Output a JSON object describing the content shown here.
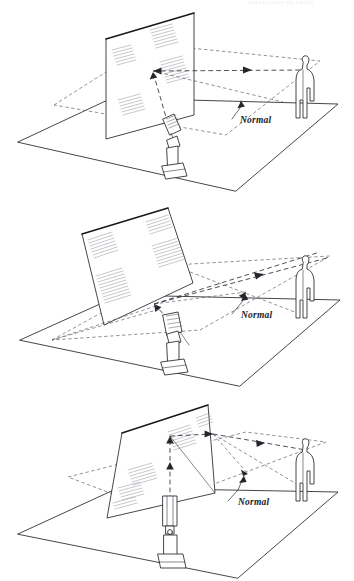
{
  "figure": {
    "page_header": "REFLECTION OF LIGHT",
    "background_color": "#ffffff",
    "line_color": "#23262b",
    "accent_color": "#15181c"
  },
  "panels": [
    {
      "id": "panel-1",
      "caption": "Mirror vertical — beam reflects horizontally toward observer",
      "normal_label": "Normal",
      "mirror": {
        "name": "plane-mirror",
        "orientation": "vertical"
      },
      "light_source": {
        "name": "projector-lamp",
        "position": "center-front"
      },
      "observer": {
        "name": "standing-person",
        "position": "right"
      },
      "ground_plane": {
        "name": "floor-plane",
        "style": "solid"
      },
      "normal_plane": {
        "name": "normal-reference-plane",
        "style": "dashed"
      },
      "rays": [
        {
          "name": "incident-ray",
          "style": "dashed",
          "arrow": true
        },
        {
          "name": "reflected-ray",
          "style": "dashed",
          "arrow": true
        },
        {
          "name": "normal-line",
          "style": "dashed",
          "arrow": false
        }
      ]
    },
    {
      "id": "panel-2",
      "caption": "Mirror tilted back — reflected beam rises above observer",
      "normal_label": "Normal",
      "mirror": {
        "name": "plane-mirror",
        "orientation": "tilted-back"
      },
      "light_source": {
        "name": "projector-lamp",
        "position": "center-front"
      },
      "observer": {
        "name": "standing-person",
        "position": "right"
      },
      "ground_plane": {
        "name": "floor-plane",
        "style": "solid"
      },
      "normal_plane": {
        "name": "normal-reference-plane",
        "style": "dashed"
      },
      "rays": [
        {
          "name": "incident-ray",
          "style": "dashed",
          "arrow": true
        },
        {
          "name": "reflected-ray",
          "style": "dashed",
          "arrow": true
        },
        {
          "name": "normal-line",
          "style": "dashed",
          "arrow": true
        }
      ]
    },
    {
      "id": "panel-3",
      "caption": "Mirror rotated sideways — beam reflects off to the right",
      "normal_label": "Normal",
      "mirror": {
        "name": "plane-mirror",
        "orientation": "rotated-oblique"
      },
      "light_source": {
        "name": "projector-lamp",
        "position": "center-front"
      },
      "observer": {
        "name": "standing-person",
        "position": "right"
      },
      "ground_plane": {
        "name": "floor-plane",
        "style": "solid"
      },
      "normal_plane": {
        "name": "normal-reference-plane",
        "style": "dashed"
      },
      "rays": [
        {
          "name": "incident-ray",
          "style": "dashed",
          "arrow": true
        },
        {
          "name": "reflected-ray",
          "style": "dashed",
          "arrow": true
        },
        {
          "name": "normal-line",
          "style": "dashed",
          "arrow": true
        }
      ]
    }
  ]
}
